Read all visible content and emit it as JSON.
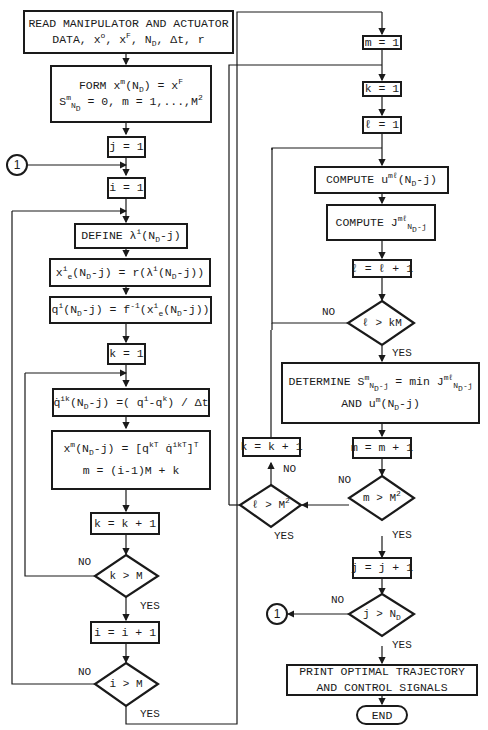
{
  "left_column": {
    "read_box": [
      "READ MANIPULATOR AND ACTUATOR",
      "DATA, x°, xᶠ, N_D, Δt, r"
    ],
    "form_box": [
      "FORM x^m(N_D) = x^F",
      "S^m_N_D = 0, m = 1,...,M²"
    ],
    "j_init": "j = 1",
    "connector_in": "1",
    "i_init": "i = 1",
    "define_box": "DEFINE λ^i(N_D-j)",
    "xe_box": "x^i_e(N_D-j) = r(λ^i(N_D-j))",
    "q_box": "q^i(N_D-j) = f^-1(x^i_e(N_D-j))",
    "k_init": "k = 1",
    "qdot_box": "q̇^ik(N_D-j) = (q^i-q^k)/Δt",
    "xm_box": [
      "x^m(N_D-j) = [q^kT q̇^ikT]^T",
      "m = (i-1)M + k"
    ],
    "k_inc": "k = k + 1",
    "k_decision": "k > M",
    "i_inc": "i = i + 1",
    "i_decision": "i > M"
  },
  "right_column": {
    "m_init": "m = 1",
    "k_init": "k = 1",
    "l_init": "ℓ = 1",
    "compute_u": "COMPUTE u^mℓ(N_D-j)",
    "compute_j": "COMPUTE J^mℓ_N_D-j",
    "l_inc": "ℓ = ℓ + 1",
    "l_decision_km": "ℓ > kM",
    "determine_box": [
      "DETERMINE S^m_N_D-j = min_ℓ J^mℓ_N_D-j",
      "AND u^m(N_D-j)"
    ],
    "k_inc": "k = k + 1",
    "l_decision_m2": "ℓ > M²",
    "m_inc": "m = m + 1",
    "m_decision": "m > M²",
    "j_inc": "j = j + 1",
    "j_decision": "j > N_D",
    "connector_out": "1",
    "print_box": [
      "PRINT OPTIMAL TRAJECTORY",
      "AND CONTROL SIGNALS"
    ],
    "end": "END"
  },
  "labels": {
    "yes": "YES",
    "no": "NO"
  }
}
